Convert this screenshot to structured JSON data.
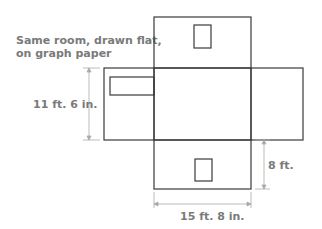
{
  "caption": {
    "line1": "Same room, drawn flat,",
    "line2": "on graph paper"
  },
  "dimensions": {
    "wall_length": "11 ft. 6 in.",
    "wall_height": "8 ft.",
    "floor_width": "15 ft. 8 in."
  },
  "colors": {
    "outline": "#3a3a3a",
    "dimension_line": "#aaaaaa",
    "text": "#7a7a7a"
  },
  "panels": [
    "top-wall",
    "left-wall",
    "floor",
    "right-wall",
    "bottom-wall"
  ]
}
